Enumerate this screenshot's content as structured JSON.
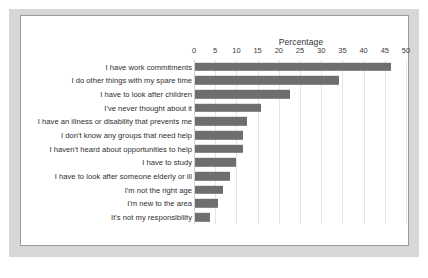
{
  "chart_data": {
    "type": "bar",
    "orientation": "horizontal",
    "title": "",
    "xlabel": "Percentage",
    "ylabel": "",
    "xlim": [
      0,
      50
    ],
    "xticks": [
      0,
      5,
      10,
      15,
      20,
      25,
      30,
      35,
      40,
      45,
      50
    ],
    "grid": "vertical",
    "legend": "none",
    "bar_color": "#6e6e6e",
    "categories": [
      "I have work commitments",
      "I do other things with my spare time",
      "I have to look after children",
      "I've never thought about it",
      "I have an illness or disability that prevents me",
      "I don't know any groups that need help",
      "I haven't heard about opportunities to help",
      "I have to study",
      "I have to look after someone elderly or ill",
      "I'm not the right age",
      "I'm new to the area",
      "It's not my responsibility"
    ],
    "values": [
      46.3,
      34.0,
      22.5,
      15.6,
      12.2,
      11.3,
      11.4,
      9.6,
      8.3,
      6.5,
      5.5,
      3.5
    ]
  },
  "colors": {
    "bar": "#6e6e6e",
    "frame": "#d7d7d7",
    "card_border": "#9a9a9a",
    "gridline": "#e4e4e4",
    "text": "#2e2e2e"
  }
}
